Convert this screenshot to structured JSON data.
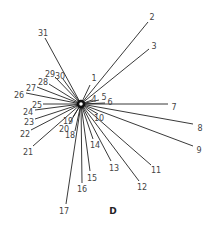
{
  "diagram": {
    "type": "star-network",
    "caption": "D",
    "hub": {
      "x": 81,
      "y": 104,
      "radius": 3
    },
    "nodes": [
      {
        "id": "1",
        "lx": 94,
        "ly": 78,
        "ex": 90,
        "ey": 85
      },
      {
        "id": "2",
        "lx": 152,
        "ly": 17,
        "ex": 148,
        "ey": 22
      },
      {
        "id": "3",
        "lx": 154,
        "ly": 46,
        "ex": 149,
        "ey": 49
      },
      {
        "id": "4",
        "lx": 94,
        "ly": 99,
        "ex": 92,
        "ey": 100
      },
      {
        "id": "5",
        "lx": 104,
        "ly": 97,
        "ex": 99,
        "ey": 100
      },
      {
        "id": "6",
        "lx": 110,
        "ly": 102,
        "ex": 105,
        "ey": 103
      },
      {
        "id": "7",
        "lx": 174,
        "ly": 107,
        "ex": 168,
        "ey": 104
      },
      {
        "id": "8",
        "lx": 200,
        "ly": 128,
        "ex": 193,
        "ey": 124
      },
      {
        "id": "9",
        "lx": 199,
        "ly": 150,
        "ex": 193,
        "ey": 146
      },
      {
        "id": "10",
        "lx": 99,
        "ly": 118,
        "ex": 98,
        "ey": 114
      },
      {
        "id": "11",
        "lx": 156,
        "ly": 170,
        "ex": 151,
        "ey": 165
      },
      {
        "id": "12",
        "lx": 142,
        "ly": 187,
        "ex": 139,
        "ey": 181
      },
      {
        "id": "13",
        "lx": 114,
        "ly": 168,
        "ex": 111,
        "ey": 161
      },
      {
        "id": "14",
        "lx": 95,
        "ly": 145,
        "ex": 93,
        "ey": 139
      },
      {
        "id": "15",
        "lx": 92,
        "ly": 178,
        "ex": 90,
        "ey": 171
      },
      {
        "id": "16",
        "lx": 82,
        "ly": 189,
        "ex": 82,
        "ey": 183
      },
      {
        "id": "17",
        "lx": 64,
        "ly": 211,
        "ex": 66,
        "ey": 204
      },
      {
        "id": "18",
        "lx": 70,
        "ly": 135,
        "ex": 75,
        "ey": 131
      },
      {
        "id": "19",
        "lx": 68,
        "ly": 121,
        "ex": 73,
        "ey": 117
      },
      {
        "id": "20",
        "lx": 64,
        "ly": 129,
        "ex": 69,
        "ey": 124
      },
      {
        "id": "21",
        "lx": 28,
        "ly": 152,
        "ex": 33,
        "ey": 146
      },
      {
        "id": "22",
        "lx": 25,
        "ly": 134,
        "ex": 31,
        "ey": 130
      },
      {
        "id": "23",
        "lx": 29,
        "ly": 122,
        "ex": 35,
        "ey": 119
      },
      {
        "id": "24",
        "lx": 28,
        "ly": 112,
        "ex": 35,
        "ey": 110
      },
      {
        "id": "25",
        "lx": 37,
        "ly": 105,
        "ex": 43,
        "ey": 104
      },
      {
        "id": "26",
        "lx": 19,
        "ly": 95,
        "ex": 26,
        "ey": 93
      },
      {
        "id": "27",
        "lx": 31,
        "ly": 88,
        "ex": 37,
        "ey": 87
      },
      {
        "id": "28",
        "lx": 43,
        "ly": 82,
        "ex": 49,
        "ey": 84
      },
      {
        "id": "29",
        "lx": 50,
        "ly": 74,
        "ex": 55,
        "ey": 77
      },
      {
        "id": "30",
        "lx": 60,
        "ly": 76,
        "ex": 63,
        "ey": 79
      },
      {
        "id": "31",
        "lx": 43,
        "ly": 33,
        "ex": 45,
        "ey": 38
      }
    ]
  }
}
